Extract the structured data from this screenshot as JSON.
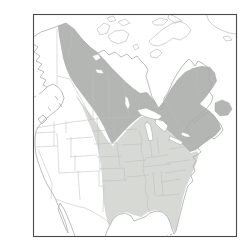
{
  "meta": {
    "map_region": "North America"
  },
  "colors": {
    "background": "#ffffff",
    "frame": "#4a4a4a",
    "coastline": "#a9aca9",
    "state_borders": "#bdbfbd",
    "dark_range": "#b3b6b2",
    "light_range": "#d7d9d5",
    "water": "#ffffff"
  },
  "regions": {
    "dark_shaded": {
      "name": "dark-shaded-range",
      "color": "#b3b6b2"
    },
    "light_shaded": {
      "name": "light-shaded-range",
      "color": "#d7d9d5"
    }
  },
  "range_paths": {
    "light_main": "M76,95 L82,103 L88,111 L94,119 L99,127 L104,135 L109,142 L113,146 L119,139 L126,131 L133,124 L140,118 L146,115 L153,119 L160,124 L167,130 L173,135 L179,141 L185,147 L191,153 L197,151 L199,154 L197,161 L194,169 L190,178 L186,187 L183,197 L181,207 L179,217 L177,227 L175,233 L171,225 L168,217 L163,212 L156,210 L148,212 L141,217 L134,215 L126,212 L118,214 L113,219 L109,226 L106,216 L104,204 L103,191 L102,178 L101,165 L99,153 L96,142 L92,130 L87,118 L82,106 L77,98 Z",
    "dark_main": "M58,26 L66,23 L74,29 L82,39 L90,47 L98,53 L105,60 L112,68 L119,75 L126,82 L133,88 L140,93 L147,92 L151,97 L155,101 L158,108 L163,102 L167,95 L172,87 L178,79 L185,72 L193,68 L202,66 L210,67 L215,73 L217,81 L212,89 L206,97 L200,104 L207,109 L214,115 L219,122 L221,129 L216,135 L209,140 L202,145 L196,150 L190,152 L184,146 L178,140 L172,134 L166,129 L159,123 L152,118 L145,114 L138,118 L131,124 L124,131 L117,139 L112,144 L108,136 L104,127 L99,118 L93,109 L87,101 L81,93 L75,85 L70,77 L66,68 L63,58 L61,47 L59,36 Z",
    "dark_newfoundland": "M215,103 L222,100 L229,103 L232,109 L228,115 L220,116 L215,111 Z"
  }
}
